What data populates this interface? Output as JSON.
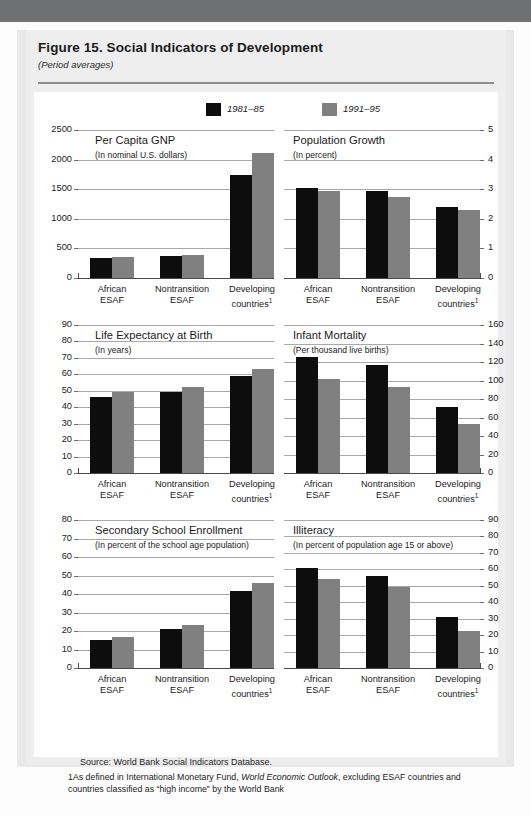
{
  "figure": {
    "title": "Figure 15.  Social Indicators of Development",
    "subtitle": "(Period averages)"
  },
  "legend": {
    "items": [
      {
        "label": "1981–85",
        "color": "#0d0d0d"
      },
      {
        "label": "1991–95",
        "color": "#808080"
      }
    ]
  },
  "footer": {
    "source": "Source: World Bank Social Indicators Database.",
    "note_pre": "1As defined in International Monetary Fund, ",
    "note_italic": "World Economic Outlook",
    "note_post": ", excluding ESAF countries and countries classified as “high income” by the World Bank"
  },
  "categories": [
    "African ESAF",
    "Nontransition ESAF",
    "Developing countries"
  ],
  "category_lines": [
    [
      "African",
      "ESAF"
    ],
    [
      "Nontransition",
      "ESAF"
    ],
    [
      "Developing",
      "countries"
    ]
  ],
  "chart_data": [
    {
      "type": "bar",
      "id": "per-capita-gnp",
      "title": "Per Capita GNP",
      "subtitle": "(In nominal U.S. dollars)",
      "xlabel": "",
      "ylabel": "",
      "axis_side": "left",
      "categories": [
        "African ESAF",
        "Nontransition ESAF",
        "Developing countries"
      ],
      "ticks": [
        0,
        500,
        1000,
        1500,
        2000,
        2500
      ],
      "ylim": [
        0,
        2500
      ],
      "grid": true,
      "legend_position": "top",
      "series": [
        {
          "name": "1981–85",
          "color": "#0d0d0d",
          "values": [
            345,
            380,
            1740
          ]
        },
        {
          "name": "1991–95",
          "color": "#808080",
          "values": [
            355,
            382,
            2120
          ]
        }
      ]
    },
    {
      "type": "bar",
      "id": "population-growth",
      "title": "Population Growth",
      "subtitle": "(In percent)",
      "xlabel": "",
      "ylabel": "",
      "axis_side": "right",
      "categories": [
        "African ESAF",
        "Nontransition ESAF",
        "Developing countries"
      ],
      "ticks": [
        0,
        1,
        2,
        3,
        4,
        5
      ],
      "ylim": [
        0,
        5
      ],
      "grid": true,
      "legend_position": "top",
      "series": [
        {
          "name": "1981–85",
          "color": "#0d0d0d",
          "values": [
            3.05,
            2.95,
            2.4
          ]
        },
        {
          "name": "1991–95",
          "color": "#808080",
          "values": [
            2.95,
            2.75,
            2.3
          ]
        }
      ]
    },
    {
      "type": "bar",
      "id": "life-expectancy-at-birth",
      "title": "Life Expectancy at Birth",
      "subtitle": "(In years)",
      "xlabel": "",
      "ylabel": "",
      "axis_side": "left",
      "categories": [
        "African ESAF",
        "Nontransition ESAF",
        "Developing countries"
      ],
      "ticks": [
        0,
        10,
        20,
        30,
        40,
        50,
        60,
        70,
        80,
        90
      ],
      "ylim": [
        0,
        90
      ],
      "grid": true,
      "legend_position": "top",
      "series": [
        {
          "name": "1981–85",
          "color": "#0d0d0d",
          "values": [
            46,
            49.5,
            59
          ]
        },
        {
          "name": "1991–95",
          "color": "#808080",
          "values": [
            49,
            52.5,
            63
          ]
        }
      ]
    },
    {
      "type": "bar",
      "id": "infant-mortality",
      "title": "Infant Mortality",
      "subtitle": "(Per thousand live births)",
      "xlabel": "",
      "ylabel": "",
      "axis_side": "right",
      "categories": [
        "African ESAF",
        "Nontransition ESAF",
        "Developing countries"
      ],
      "ticks": [
        0,
        20,
        40,
        60,
        80,
        100,
        120,
        140,
        160
      ],
      "ylim": [
        0,
        160
      ],
      "grid": true,
      "legend_position": "top",
      "series": [
        {
          "name": "1981–85",
          "color": "#0d0d0d",
          "values": [
            125,
            117,
            71
          ]
        },
        {
          "name": "1991–95",
          "color": "#808080",
          "values": [
            102,
            93,
            53
          ]
        }
      ]
    },
    {
      "type": "bar",
      "id": "secondary-school-enrollment",
      "title": "Secondary School Enrollment",
      "subtitle": "(In percent of the school age population)",
      "xlabel": "",
      "ylabel": "",
      "axis_side": "left",
      "categories": [
        "African ESAF",
        "Nontransition ESAF",
        "Developing countries"
      ],
      "ticks": [
        0,
        10,
        20,
        30,
        40,
        50,
        60,
        70,
        80
      ],
      "ylim": [
        0,
        80
      ],
      "grid": true,
      "legend_position": "top",
      "series": [
        {
          "name": "1981–85",
          "color": "#0d0d0d",
          "values": [
            15,
            21,
            41.5
          ]
        },
        {
          "name": "1991–95",
          "color": "#808080",
          "values": [
            17,
            23,
            46
          ]
        }
      ]
    },
    {
      "type": "bar",
      "id": "illiteracy",
      "title": "Illiteracy",
      "subtitle": "(In percent of population age 15 or above)",
      "xlabel": "",
      "ylabel": "",
      "axis_side": "right",
      "categories": [
        "African ESAF",
        "Nontransition ESAF",
        "Developing countries"
      ],
      "ticks": [
        0,
        10,
        20,
        30,
        40,
        50,
        60,
        70,
        80,
        90
      ],
      "ylim": [
        0,
        90
      ],
      "grid": true,
      "legend_position": "top",
      "series": [
        {
          "name": "1981–85",
          "color": "#0d0d0d",
          "values": [
            61,
            56,
            31
          ]
        },
        {
          "name": "1991–95",
          "color": "#808080",
          "values": [
            54,
            49,
            22.5
          ]
        }
      ]
    }
  ]
}
